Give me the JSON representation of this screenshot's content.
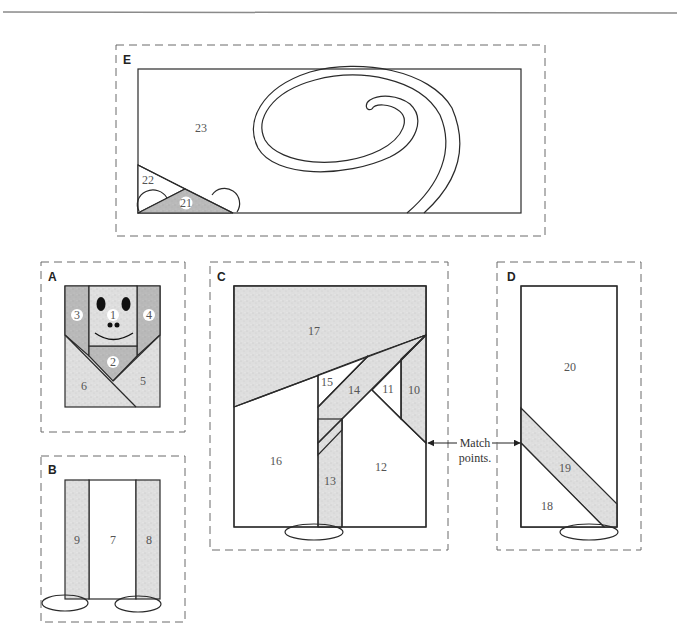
{
  "figure": {
    "type": "quilt block piecing diagram",
    "colors": {
      "light_fabric": "#dcdcdc",
      "dark_fabric": "#b5b5b5",
      "outline": "#2a2a2a",
      "dashed_border": "#6b6b6b",
      "top_rule": "#8a8a8a"
    }
  },
  "blocks": {
    "E": {
      "label": "E",
      "pieces": [
        "21",
        "22",
        "23"
      ]
    },
    "A": {
      "label": "A",
      "pieces": [
        "1",
        "2",
        "3",
        "4",
        "5",
        "6"
      ]
    },
    "B": {
      "label": "B",
      "pieces": [
        "7",
        "8",
        "9"
      ]
    },
    "C": {
      "label": "C",
      "pieces": [
        "10",
        "11",
        "12",
        "13",
        "14",
        "15",
        "16",
        "17"
      ]
    },
    "D": {
      "label": "D",
      "pieces": [
        "18",
        "19",
        "20"
      ]
    }
  },
  "annotation": {
    "line1": "Match",
    "line2": "points."
  }
}
